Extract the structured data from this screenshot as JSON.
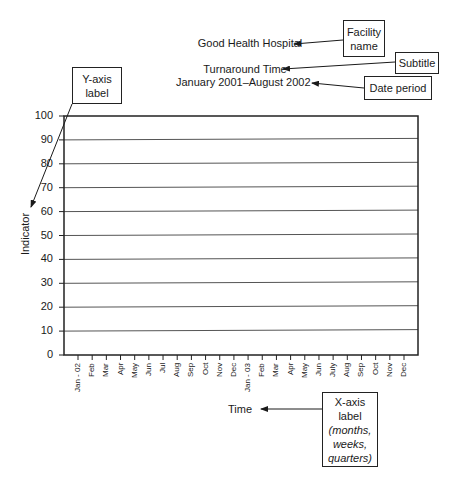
{
  "titles": {
    "facility": "Good Health Hospital",
    "subtitle": "Turnaround Time",
    "date_period": "January 2001–August 2002"
  },
  "callouts": {
    "facility_name": [
      "Facility",
      "name"
    ],
    "subtitle": "Subtitle",
    "date_period": "Date period",
    "y_axis": [
      "Y-axis",
      "label"
    ],
    "x_axis": [
      "X-axis",
      "label",
      "(months,",
      "weeks,",
      "quarters)"
    ]
  },
  "axes": {
    "y_label": "Indicator",
    "x_label": "Time"
  },
  "chart_data": {
    "type": "line",
    "title": "Good Health Hospital",
    "subtitle": "Turnaround Time / January 2001–August 2002",
    "xlabel": "Time",
    "ylabel": "Indicator",
    "ylim": [
      0,
      100
    ],
    "yticks": [
      "0",
      "10",
      "20",
      "30",
      "40",
      "50",
      "60",
      "70",
      "80",
      "90",
      "100"
    ],
    "categories": [
      "Jan - 02",
      "Feb",
      "Mar",
      "Apr",
      "May",
      "Jun",
      "Jul",
      "Aug",
      "Sep",
      "Oct",
      "Nov",
      "Dec",
      "Jan - 03",
      "Feb",
      "Mar",
      "Apr",
      "May",
      "Jun",
      "July",
      "Aug",
      "Sep",
      "Oct",
      "Nov",
      "Dec"
    ],
    "series": [],
    "grid": true,
    "annotations": [
      "Facility name",
      "Subtitle",
      "Date period",
      "Y-axis label",
      "X-axis label (months, weeks, quarters)"
    ]
  }
}
